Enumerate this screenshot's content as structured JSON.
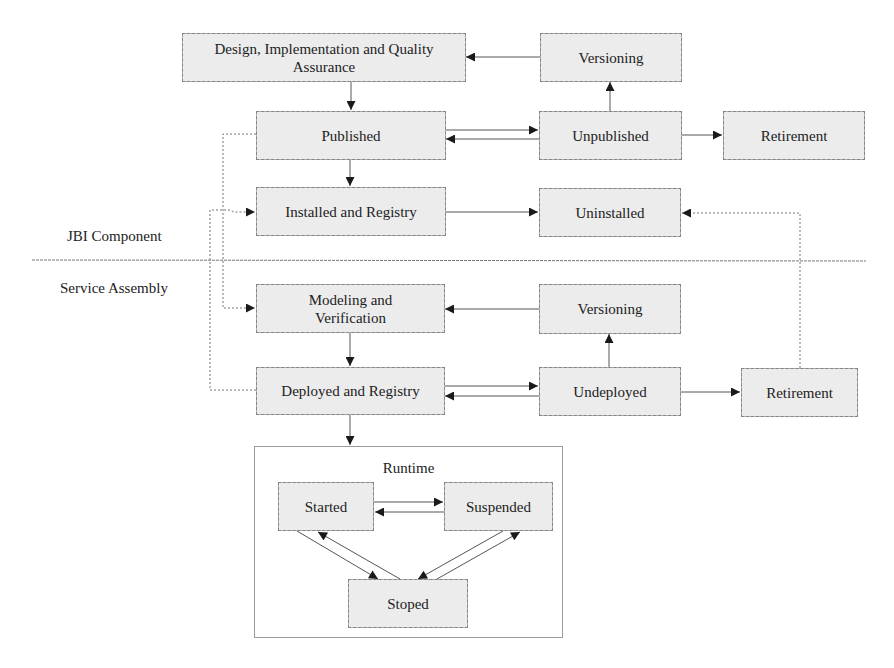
{
  "lanes": {
    "top_label": "JBI Component",
    "bottom_label": "Service Assembly"
  },
  "jbi_component": {
    "design": "Design, Implementation and Quality Assurance",
    "versioning": "Versioning",
    "published": "Published",
    "unpublished": "Unpublished",
    "retirement": "Retirement",
    "installed": "Installed and Registry",
    "uninstalled": "Uninstalled"
  },
  "service_assembly": {
    "modeling": "Modeling and Verification",
    "versioning": "Versioning",
    "deployed": "Deployed and Registry",
    "undeployed": "Undeployed",
    "retirement": "Retirement"
  },
  "runtime": {
    "title": "Runtime",
    "started": "Started",
    "suspended": "Suspended",
    "stopped": "Stoped"
  },
  "edges": [
    {
      "from": "Design, Implementation and Quality Assurance",
      "to": "Published",
      "style": "solid"
    },
    {
      "from": "Versioning",
      "to": "Design, Implementation and Quality Assurance",
      "style": "solid"
    },
    {
      "from": "Unpublished",
      "to": "Versioning",
      "style": "solid"
    },
    {
      "from": "Published",
      "to": "Unpublished",
      "style": "solid"
    },
    {
      "from": "Unpublished",
      "to": "Published",
      "style": "solid"
    },
    {
      "from": "Unpublished",
      "to": "Retirement",
      "style": "solid"
    },
    {
      "from": "Published",
      "to": "Installed and Registry",
      "style": "solid"
    },
    {
      "from": "Installed and Registry",
      "to": "Uninstalled",
      "style": "solid"
    },
    {
      "from": "Retirement (Service Assembly)",
      "to": "Uninstalled",
      "style": "dotted"
    },
    {
      "from": "Published",
      "to": "Modeling and Verification",
      "style": "dotted"
    },
    {
      "from": "Deployed and Registry",
      "to": "Installed and Registry",
      "style": "dotted"
    },
    {
      "from": "Versioning (Service Assembly)",
      "to": "Modeling and Verification",
      "style": "solid"
    },
    {
      "from": "Modeling and Verification",
      "to": "Deployed and Registry",
      "style": "solid"
    },
    {
      "from": "Undeployed",
      "to": "Versioning (Service Assembly)",
      "style": "solid"
    },
    {
      "from": "Deployed and Registry",
      "to": "Undeployed",
      "style": "solid"
    },
    {
      "from": "Undeployed",
      "to": "Deployed and Registry",
      "style": "solid"
    },
    {
      "from": "Undeployed",
      "to": "Retirement (Service Assembly)",
      "style": "solid"
    },
    {
      "from": "Deployed and Registry",
      "to": "Runtime",
      "style": "solid"
    },
    {
      "from": "Started",
      "to": "Suspended",
      "style": "solid"
    },
    {
      "from": "Suspended",
      "to": "Started",
      "style": "solid"
    },
    {
      "from": "Started",
      "to": "Stoped",
      "style": "solid"
    },
    {
      "from": "Stoped",
      "to": "Started",
      "style": "solid"
    },
    {
      "from": "Suspended",
      "to": "Stoped",
      "style": "solid"
    },
    {
      "from": "Stoped",
      "to": "Suspended",
      "style": "solid"
    }
  ],
  "colors": {
    "node_fill": "#ececec",
    "node_border": "#8a8a8a",
    "edge": "#555555",
    "arrowhead": "#1a1a1a",
    "text": "#222222"
  }
}
